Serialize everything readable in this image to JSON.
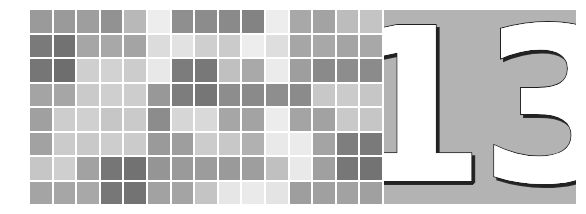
{
  "page": {
    "width": 586,
    "height": 214,
    "background": "#ffffff"
  },
  "chapter_header": {
    "number": "13",
    "panel_background": "#b3b3b3",
    "number_fill": "#ffffff",
    "number_shadow": "#1f1f1f"
  },
  "mosaic": {
    "columns": 15,
    "rows": 8,
    "gap_color": "#ffffff",
    "palette": {
      "darkest": "#6e6e6e",
      "dark": "#7d7d7d",
      "medium_dark": "#8d8d8d",
      "medium": "#a0a0a0",
      "medium_light": "#b4b4b4",
      "light": "#c8c8c8",
      "lighter": "#dcdcdc",
      "lightest": "#ededed"
    },
    "grid": [
      [
        "#9a9a9a",
        "#9a9a9a",
        "#9e9e9e",
        "#929292",
        "#b8b8b8",
        "#ededed",
        "#8f8f8f",
        "#8c8c8c",
        "#8a8a8a",
        "#838383",
        "#ededed",
        "#a8a8a8",
        "#a3a3a3",
        "#bcbcbc",
        "#c4c4c4"
      ],
      [
        "#7a7a7a",
        "#727272",
        "#a6a6a6",
        "#a8a8a8",
        "#a4a4a4",
        "#dcdcdc",
        "#e2e2e2",
        "#cfcfcf",
        "#cbcbcb",
        "#ededed",
        "#dedede",
        "#a6a6a6",
        "#a8a8a8",
        "#a4a4a4",
        "#a8a8a8"
      ],
      [
        "#767676",
        "#6e6e6e",
        "#cfcfcf",
        "#d2d2d2",
        "#cccccc",
        "#e8e8e8",
        "#7c7c7c",
        "#787878",
        "#c0c0c0",
        "#a9a9a9",
        "#ebebeb",
        "#9e9e9e",
        "#8a8a8a",
        "#8d8d8d",
        "#8b8b8b"
      ],
      [
        "#a4a4a4",
        "#a6a6a6",
        "#cacaca",
        "#cfcfcf",
        "#cdcdcd",
        "#989898",
        "#7d7d7d",
        "#767676",
        "#8d8d8d",
        "#8a8a8a",
        "#8e8e8e",
        "#8b8b8b",
        "#c8c8c8",
        "#cbcbcb",
        "#c6c6c6"
      ],
      [
        "#a0a0a0",
        "#cdcdcd",
        "#d0d0d0",
        "#c6c6c6",
        "#cacaca",
        "#8c8c8c",
        "#d6d6d6",
        "#d9d9d9",
        "#a6a6a6",
        "#a3a3a3",
        "#ececec",
        "#a4a4a4",
        "#a2a2a2",
        "#c9c9c9",
        "#c6c6c6"
      ],
      [
        "#a2a2a2",
        "#cbcbcb",
        "#c9c9c9",
        "#cdcdcd",
        "#cbcbcb",
        "#9a9a9a",
        "#9e9e9e",
        "#cccccc",
        "#c8c8c8",
        "#b1b1b1",
        "#e9e9e9",
        "#ebebeb",
        "#a4a4a4",
        "#7e7e7e",
        "#7a7a7a"
      ],
      [
        "#c6c6c6",
        "#cfcfcf",
        "#a2a2a2",
        "#767676",
        "#727272",
        "#959595",
        "#9a9a9a",
        "#9c9c9c",
        "#9a9a9a",
        "#9e9e9e",
        "#c0c0c0",
        "#e9e9e9",
        "#a0a0a0",
        "#777777",
        "#737373"
      ],
      [
        "#a4a4a4",
        "#a6a6a6",
        "#a8a8a8",
        "#777777",
        "#737373",
        "#a2a2a2",
        "#a4a4a4",
        "#c4c4c4",
        "#e6e6e6",
        "#eaeaea",
        "#e4e4e4",
        "#9e9e9e",
        "#a0a0a0",
        "#a2a2a2",
        "#a0a0a0"
      ]
    ]
  }
}
